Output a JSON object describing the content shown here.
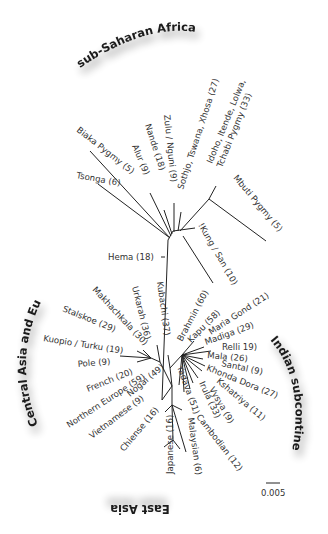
{
  "diagram": {
    "type": "unrooted phylogenetic tree",
    "regions": {
      "africa": "sub-Saharan Africa",
      "europe": "Central Asia and Europe",
      "india": "Indian subcontinent",
      "eastasia": "East Asia"
    },
    "scale_bar": "0.005",
    "labels": {
      "biaka": "Biaka Pygmy (5)",
      "tsonga": "Tsonga (6)",
      "alur": "Alur (9)",
      "nande": "Nande (18)",
      "zulu": "Zulu / Nguni (9)",
      "sothjo": "Sothjo, Tswana, Xhosa (27)",
      "idoho1": "Idoho, Itende, Lolwa,",
      "idoho2": "Tchabi Pygmy (33)",
      "mbuti": "Mbuti Pygmy (5)",
      "kung": "!Kung / San (10)",
      "hema": "Hema (18)",
      "kubachi": "Kubachi (37)",
      "urkarah": "Urkarah (36)",
      "makhachkala": "Makhachkala (30)",
      "stalskoe": "Stalskoe (29)",
      "kuopio": "Kuopio / Turku (19)",
      "pole": "Pole (9)",
      "french": "French (20)",
      "northern_europe": "Northern Europe (59)",
      "nogai": "Nogai (49)",
      "vietnamese": "Vietnamese (9)",
      "chinese": "Chiense (16)",
      "japanese": "Japanese (16)",
      "malaysian": "Malaysian (6)",
      "cambodian": "Cambodian (12)",
      "yadava": "Yadava (51)",
      "irula": "Irula (33)",
      "vysya": "Vysya (9)",
      "kshatriya": "Kshatriya (11)",
      "khonda": "Khonda Dora (27)",
      "santal": "Santal (9)",
      "mala": "Mala (26)",
      "relli": "Relli 19)",
      "madiga": "Madiga (29)",
      "maria": "Maria Gond (21)",
      "kapu": "Kapu (58)",
      "brahmin": "Brahmin (60)"
    }
  }
}
